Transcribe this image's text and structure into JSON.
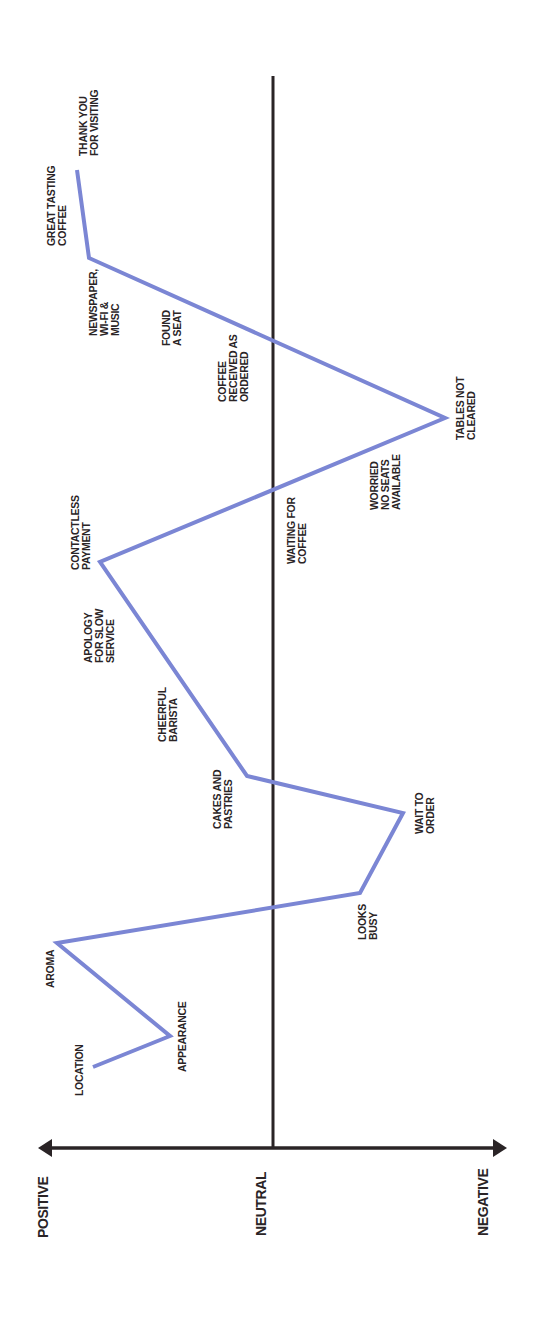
{
  "chart_data": {
    "type": "line",
    "title": "",
    "orientation": "rotated 90° counter-clockwise (time runs bottom-to-top, sentiment runs left-to-right)",
    "axis": {
      "labels": [
        "POSITIVE",
        "NEUTRAL",
        "NEGATIVE"
      ],
      "description": "Sentiment axis from Positive (left) through Neutral (center) to Negative (right)"
    },
    "colors": {
      "line": "#7b86d4",
      "axis": "#2a2426",
      "text": "#2a2426"
    },
    "points": [
      {
        "label": "LOCATION",
        "sentiment": 0.77,
        "x": 93,
        "y": 1067
      },
      {
        "label": "APPEARANCE",
        "sentiment": 0.44,
        "x": 170,
        "y": 1036
      },
      {
        "label": "AROMA",
        "sentiment": 0.92,
        "x": 57,
        "y": 943
      },
      {
        "label": "LOOKS BUSY",
        "sentiment": -0.37,
        "x": 360,
        "y": 893
      },
      {
        "label": "WAIT TO ORDER",
        "sentiment": -0.56,
        "x": 403,
        "y": 813
      },
      {
        "label": "CAKES AND PASTRIES",
        "sentiment": 0.11,
        "x": 247,
        "y": 776
      },
      {
        "label": "CHEERFUL BARISTA",
        "sentiment": null
      },
      {
        "label": "APOLOGY FOR SLOW SERVICE",
        "sentiment": null
      },
      {
        "label": "CONTACTLESS PAYMENT",
        "sentiment": 0.74,
        "x": 100,
        "y": 562
      },
      {
        "label": "WAITING FOR COFFEE",
        "sentiment": null
      },
      {
        "label": "WORRIED NO SEATS AVAILABLE",
        "sentiment": null
      },
      {
        "label": "TABLES NOT CLEARED",
        "sentiment": -0.73,
        "x": 445,
        "y": 418
      },
      {
        "label": "COFFEE RECEIVED AS ORDERED",
        "sentiment": null
      },
      {
        "label": "FOUND A SEAT",
        "sentiment": null
      },
      {
        "label": "NEWSPAPER, WI-FI & MUSIC",
        "sentiment": 0.79,
        "x": 89,
        "y": 258
      },
      {
        "label": "GREAT TASTING COFFEE",
        "sentiment": null
      },
      {
        "label": "THANK YOU FOR VISITING",
        "sentiment": 0.84,
        "x": 77,
        "y": 170
      }
    ],
    "polyline": "93,1067 170,1036 57,943 360,893 403,813 247,776 100,562 445,418 89,258 77,170"
  },
  "labels": {
    "positive": "POSITIVE",
    "neutral": "NEUTRAL",
    "negative": "NEGATIVE",
    "location": "LOCATION",
    "appearance": "APPEARANCE",
    "aroma": "AROMA",
    "looks_busy": [
      "LOOKS",
      "BUSY"
    ],
    "wait_to_order": [
      "WAIT TO",
      "ORDER"
    ],
    "cakes": [
      "CAKES AND",
      "PASTRIES"
    ],
    "cheerful": [
      "CHEERFUL",
      "BARISTA"
    ],
    "apology": [
      "APOLOGY",
      "FOR SLOW",
      "SERVICE"
    ],
    "contactless": [
      "CONTACTLESS",
      "PAYMENT"
    ],
    "waiting": [
      "WAITING FOR",
      "COFFEE"
    ],
    "worried": [
      "WORRIED",
      "NO SEATS",
      "AVAILABLE"
    ],
    "tables": [
      "TABLES NOT",
      "CLEARED"
    ],
    "coffee_received": [
      "COFFEE",
      "RECEIVED AS",
      "ORDERED"
    ],
    "found_seat": [
      "FOUND",
      "A SEAT"
    ],
    "newspaper": [
      "NEWSPAPER,",
      "WI-FI &",
      "MUSIC"
    ],
    "great_coffee": [
      "GREAT TASTING",
      "COFFEE"
    ],
    "thank_you": [
      "THANK YOU",
      "FOR VISITING"
    ]
  }
}
